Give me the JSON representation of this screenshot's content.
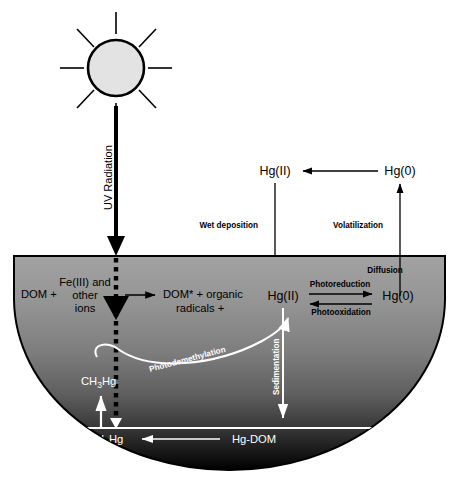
{
  "figure": {
    "background_color": "#ffffff"
  },
  "atmosphere": {
    "sun": {
      "name": "sun",
      "fill_color": "#e0e0e0",
      "stroke_color": "#000000",
      "ray_count": 8
    },
    "uv_arrow_label": "UV Radiation",
    "species": [
      {
        "id": "hg2_air",
        "label": "Hg(II)"
      },
      {
        "id": "hg0_air",
        "label": "Hg(0)"
      }
    ],
    "flux_labels": [
      {
        "id": "wet-deposition",
        "label": "Wet deposition"
      },
      {
        "id": "volatilization",
        "label": "Volatilization"
      }
    ]
  },
  "water": {
    "name": "water-body",
    "gradient_top_color": "#9b9b9b",
    "gradient_bottom_color": "#000000",
    "outline_color": "#000000",
    "reaction": {
      "reactant_left": "DOM +",
      "reactant_middle_line1": "Fe(III) and",
      "reactant_middle_line2": "other",
      "reactant_middle_line3": "ions",
      "product_line1": "DOM* + organic",
      "product_line2": "radicals +"
    },
    "species": [
      {
        "id": "hg2_water",
        "label": "Hg(II)"
      },
      {
        "id": "hg0_water",
        "label": "Hg(0)"
      },
      {
        "id": "ch3hg_water",
        "label": "CH",
        "sub": "3",
        "post": "Hg"
      }
    ],
    "process_labels": [
      {
        "id": "diffusion",
        "label": "Diffusion"
      },
      {
        "id": "photoreduction",
        "label": "Photoreduction"
      },
      {
        "id": "photooxidation",
        "label": "Photooxidation"
      },
      {
        "id": "photodemethylation",
        "label": "Photodemethylation"
      },
      {
        "id": "sedimentation",
        "label": "Sedimentation"
      }
    ]
  },
  "sediment": {
    "name": "sediment-layer",
    "line_color": "#ffffff",
    "species": [
      {
        "id": "ch3hg_sed",
        "label": "CH",
        "sub": "3",
        "post": "Hg"
      },
      {
        "id": "hg_dom_sed",
        "label": "Hg-DOM"
      }
    ]
  }
}
